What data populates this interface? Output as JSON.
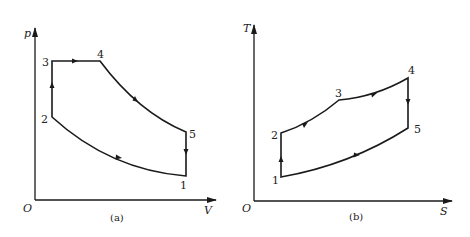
{
  "diagrams": [
    {
      "id": "a",
      "caption": "(a)",
      "type": "p-V cycle diagram",
      "x_axis_label": "V",
      "y_axis_label": "p",
      "origin_label": "O",
      "points": [
        {
          "label": "1"
        },
        {
          "label": "2"
        },
        {
          "label": "3"
        },
        {
          "label": "4"
        },
        {
          "label": "5"
        }
      ],
      "processes": [
        {
          "from": "1",
          "to": "2",
          "shape": "curve (compression)"
        },
        {
          "from": "2",
          "to": "3",
          "shape": "vertical line (constant volume)"
        },
        {
          "from": "3",
          "to": "4",
          "shape": "horizontal line (constant pressure)"
        },
        {
          "from": "4",
          "to": "5",
          "shape": "curve (expansion)"
        },
        {
          "from": "5",
          "to": "1",
          "shape": "vertical line (constant volume)"
        }
      ]
    },
    {
      "id": "b",
      "caption": "(b)",
      "type": "T-S cycle diagram",
      "x_axis_label": "S",
      "y_axis_label": "T",
      "origin_label": "O",
      "points": [
        {
          "label": "1"
        },
        {
          "label": "2"
        },
        {
          "label": "3"
        },
        {
          "label": "4"
        },
        {
          "label": "5"
        }
      ],
      "processes": [
        {
          "from": "1",
          "to": "2",
          "shape": "vertical line (isentropic)"
        },
        {
          "from": "2",
          "to": "3",
          "shape": "curve"
        },
        {
          "from": "3",
          "to": "4",
          "shape": "curve"
        },
        {
          "from": "4",
          "to": "5",
          "shape": "vertical line (isentropic)"
        },
        {
          "from": "5",
          "to": "1",
          "shape": "curve"
        }
      ]
    }
  ]
}
